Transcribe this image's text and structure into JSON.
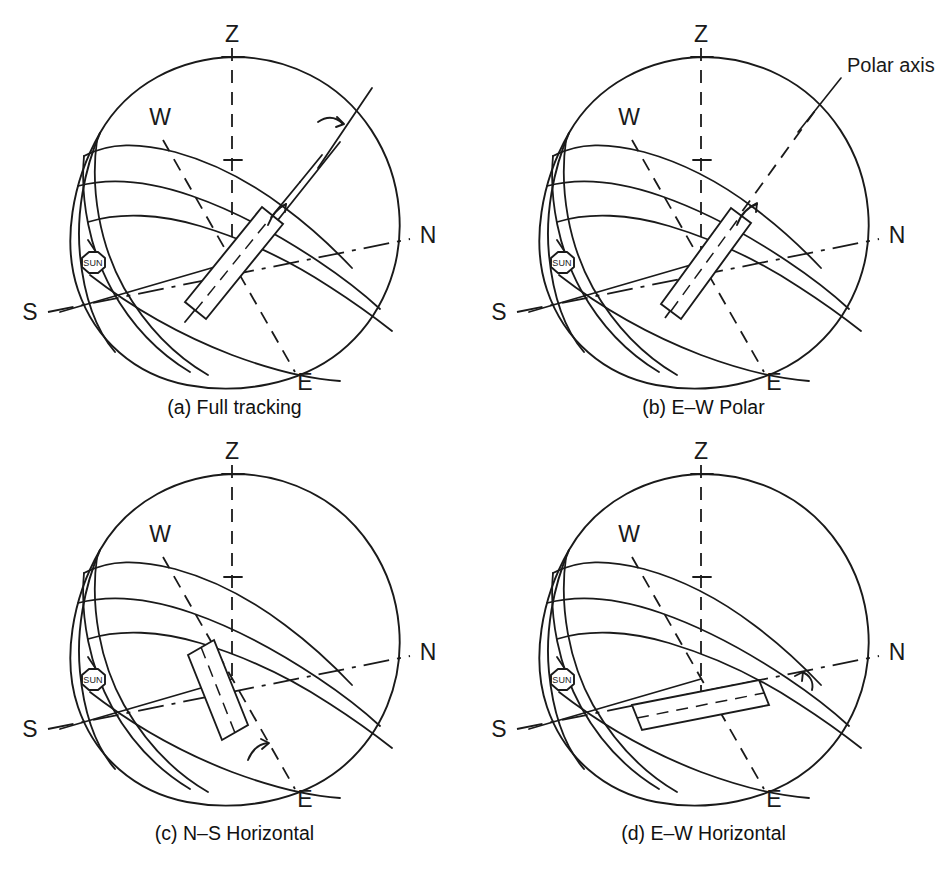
{
  "figure": {
    "background_color": "#ffffff",
    "line_color": "#1a1a1a",
    "width": 938,
    "height": 874
  },
  "cardinals": {
    "zenith": "Z",
    "north": "N",
    "south": "S",
    "east": "E",
    "west": "W"
  },
  "sun": {
    "marker_label": "SUN",
    "marker_shape": "octagon"
  },
  "annotations": {
    "polar_axis": "Polar axis"
  },
  "panels": [
    {
      "id": "a",
      "caption": "(a) Full tracking",
      "tracking_mode": "Full tracking",
      "rotation_axes": 2,
      "collector_orientation": "tilted-two-axis",
      "has_polar_axis_label": false,
      "labels": {
        "zenith": "Z",
        "north": "N",
        "south": "S",
        "east": "E",
        "west": "W",
        "sun": "SUN"
      }
    },
    {
      "id": "b",
      "caption": "(b) E–W Polar",
      "tracking_mode": "E–W Polar",
      "rotation_axes": 1,
      "collector_orientation": "polar-tilted",
      "has_polar_axis_label": true,
      "labels": {
        "zenith": "Z",
        "north": "N",
        "south": "S",
        "east": "E",
        "west": "W",
        "sun": "SUN",
        "polar_axis": "Polar axis"
      }
    },
    {
      "id": "c",
      "caption": "(c) N–S Horizontal",
      "tracking_mode": "N–S Horizontal",
      "rotation_axes": 1,
      "collector_orientation": "horizontal-north-south",
      "has_polar_axis_label": false,
      "labels": {
        "zenith": "Z",
        "north": "N",
        "south": "S",
        "east": "E",
        "west": "W",
        "sun": "SUN"
      }
    },
    {
      "id": "d",
      "caption": "(d) E–W Horizontal",
      "tracking_mode": "E–W Horizontal",
      "rotation_axes": 1,
      "collector_orientation": "horizontal-east-west",
      "has_polar_axis_label": false,
      "labels": {
        "zenith": "Z",
        "north": "N",
        "south": "S",
        "east": "E",
        "west": "W",
        "sun": "SUN"
      }
    }
  ]
}
